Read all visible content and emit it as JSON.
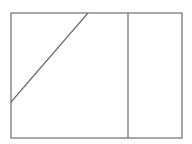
{
  "diagram": {
    "width": 192,
    "height": 144,
    "background": "#ffffff",
    "stroke_color": "#6e6e6e",
    "stroke_width": 1.2,
    "outer_rect": {
      "x": 11,
      "y": 13,
      "width": 171,
      "height": 125
    },
    "vertical_divider": {
      "x": 128,
      "y1": 13,
      "y2": 138
    },
    "diagonal_line": {
      "x1": 11,
      "y1": 102,
      "x2": 88,
      "y2": 13
    }
  }
}
